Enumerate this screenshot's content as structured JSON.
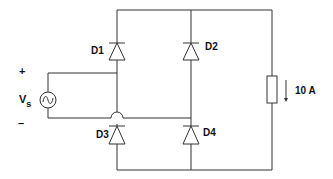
{
  "diagram": {
    "type": "full-wave bridge rectifier circuit",
    "source": {
      "label": "V",
      "subscript": "s",
      "plus": "+",
      "minus": "–",
      "symbol": "ac-source-icon"
    },
    "diodes": [
      {
        "id": "D1",
        "label": "D1",
        "position": "top-left"
      },
      {
        "id": "D2",
        "label": "D2",
        "position": "top-right"
      },
      {
        "id": "D3",
        "label": "D3",
        "position": "bottom-left"
      },
      {
        "id": "D4",
        "label": "D4",
        "position": "bottom-right"
      }
    ],
    "load": {
      "symbol": "resistor",
      "current_label": "10 A",
      "current_direction": "down"
    },
    "colors": {
      "line": "#333333",
      "text": "#111111",
      "background": "#ffffff"
    }
  }
}
